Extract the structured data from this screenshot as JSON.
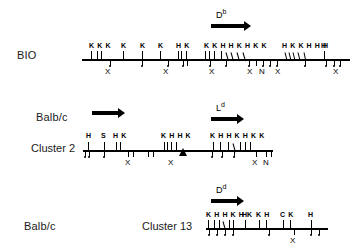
{
  "figure": {
    "type": "restriction-map"
  },
  "rows": [
    {
      "id": "bio",
      "haplotype_label": "BIO",
      "cluster_label": "",
      "gene": {
        "symbol": "D",
        "superscript": "b"
      },
      "arrow": true,
      "site_groups": [
        {
          "letters": "K K K",
          "x": 85
        },
        {
          "letters": "K",
          "x": 118
        },
        {
          "letters": "K",
          "x": 138
        },
        {
          "letters": "K",
          "x": 157
        },
        {
          "letters": "H K",
          "x": 177
        },
        {
          "letters": "K K H H K H K K",
          "x": 205
        },
        {
          "letters": "H K K H H H",
          "x": 283
        },
        {
          "letters": "H",
          "x": 322
        }
      ],
      "x_marks": [
        {
          "label": "X",
          "x": 108
        },
        {
          "label": "X",
          "x": 166
        },
        {
          "label": "X",
          "x": 212
        },
        {
          "label": "X",
          "x": 250
        },
        {
          "label": "N",
          "x": 262
        },
        {
          "label": "X",
          "x": 278
        },
        {
          "label": "X",
          "x": 337
        }
      ]
    },
    {
      "id": "cluster2",
      "haplotype_label": "Balb/c",
      "cluster_label": "Cluster 2",
      "gene": {
        "symbol": "L",
        "superscript": "d"
      },
      "arrow": true,
      "second_arrow": true,
      "site_groups": [
        {
          "letters": "H",
          "x": 88
        },
        {
          "letters": "S",
          "x": 102
        },
        {
          "letters": "H K",
          "x": 115
        },
        {
          "letters": "K H H K",
          "x": 163
        },
        {
          "letters": "K H H K H K K",
          "x": 212
        }
      ],
      "x_marks": [
        {
          "label": "X",
          "x": 128
        },
        {
          "label": "X",
          "x": 172
        },
        {
          "label": "X",
          "x": 255
        },
        {
          "label": "N",
          "x": 266
        }
      ],
      "triangle": {
        "x": 180
      }
    },
    {
      "id": "cluster13",
      "haplotype_label": "Balb/c",
      "cluster_label": "Cluster 13",
      "gene": {
        "symbol": "D",
        "superscript": "d"
      },
      "arrow": true,
      "site_groups": [
        {
          "letters": "K H H K H K",
          "x": 207
        },
        {
          "letters": "H",
          "x": 242
        },
        {
          "letters": "K H",
          "x": 258
        },
        {
          "letters": "C K",
          "x": 283
        },
        {
          "letters": "H",
          "x": 310
        }
      ],
      "x_marks": [
        {
          "label": "X",
          "x": 292
        }
      ]
    }
  ],
  "legend": {
    "enzymes": [
      "K",
      "H",
      "S",
      "C",
      "X",
      "N"
    ]
  },
  "colors": {
    "line": "#000000",
    "background": "#ffffff",
    "text": "#1a1a1a"
  }
}
